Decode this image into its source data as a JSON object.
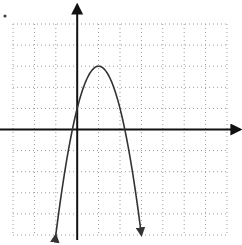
{
  "chart_data": {
    "type": "line",
    "title": "",
    "xlabel": "",
    "ylabel": "",
    "xlim": [
      -3,
      7
    ],
    "ylim": [
      -5,
      5
    ],
    "grid": true,
    "grid_style": "dotted",
    "equation": "y = -2(x - 1)^2 + 3",
    "vertex": [
      1,
      3
    ],
    "x_intercepts": [
      -0.22,
      2.22
    ],
    "y_intercept": 1,
    "series": [
      {
        "name": "parabola",
        "x": [
          -1,
          -0.5,
          0,
          0.5,
          1,
          1.5,
          2,
          2.5,
          3
        ],
        "y": [
          -5,
          -1.5,
          1,
          2.5,
          3,
          2.5,
          1,
          -1.5,
          -5
        ],
        "endpoints_arrows": true
      }
    ]
  },
  "colors": {
    "axis": "#111111",
    "curve": "#333333",
    "grid": "#9a9a9a",
    "background": "#ffffff"
  },
  "marker": "•"
}
